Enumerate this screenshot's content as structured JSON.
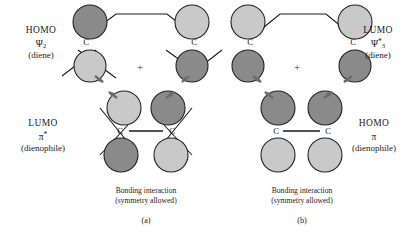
{
  "figure": {
    "plus_symbol": "+",
    "carbon_label": "C"
  },
  "colors": {
    "lobe_dark": "#8a8a8a",
    "lobe_light": "#c9c9c9",
    "outline": "#222222",
    "bond": "#1a1a1a",
    "arrow": "#6b6b6b",
    "background": "#ffffff"
  },
  "panels": [
    {
      "id": "a",
      "panel_label": "(a)",
      "caption_line1": "Bonding interaction",
      "caption_line2": "(symmetry allowed)",
      "top_label": {
        "line1": "HOMO",
        "line2_base": "Ψ",
        "line2_sub": "2",
        "line2_star": "",
        "line3": "(diene)",
        "side": "left"
      },
      "bottom_label": {
        "line1": "LUMO",
        "line2_base": "π",
        "line2_sub": "",
        "line2_star": "*",
        "line3": "(dienophile)",
        "side": "left"
      },
      "diene_lobes": [
        {
          "position": "top-left-upper",
          "phase": "dark"
        },
        {
          "position": "top-left-lower",
          "phase": "light"
        },
        {
          "position": "top-right-upper",
          "phase": "light"
        },
        {
          "position": "top-right-lower",
          "phase": "dark"
        }
      ],
      "dienophile_lobes": [
        {
          "position": "bottom-left-upper",
          "phase": "light"
        },
        {
          "position": "bottom-left-lower",
          "phase": "dark"
        },
        {
          "position": "bottom-right-upper",
          "phase": "dark"
        },
        {
          "position": "bottom-right-lower",
          "phase": "light"
        }
      ],
      "has_nodal_ticks": true,
      "arrow_count": 2
    },
    {
      "id": "b",
      "panel_label": "(b)",
      "caption_line1": "Bonding interaction",
      "caption_line2": "(symmetry allowed)",
      "top_label": {
        "line1": "LUMO",
        "line2_base": "Ψ",
        "line2_sub": "3",
        "line2_star": "*",
        "line3": "(diene)",
        "side": "right"
      },
      "bottom_label": {
        "line1": "HOMO",
        "line2_base": "π",
        "line2_sub": "",
        "line2_star": "",
        "line3": "(dienophile)",
        "side": "right"
      },
      "diene_lobes": [
        {
          "position": "top-left-upper",
          "phase": "light"
        },
        {
          "position": "top-left-lower",
          "phase": "dark"
        },
        {
          "position": "top-right-upper",
          "phase": "light"
        },
        {
          "position": "top-right-lower",
          "phase": "dark"
        }
      ],
      "dienophile_lobes": [
        {
          "position": "bottom-left-upper",
          "phase": "dark"
        },
        {
          "position": "bottom-left-lower",
          "phase": "light"
        },
        {
          "position": "bottom-right-upper",
          "phase": "dark"
        },
        {
          "position": "bottom-right-lower",
          "phase": "light"
        }
      ],
      "has_nodal_ticks": false,
      "arrow_count": 2
    }
  ]
}
